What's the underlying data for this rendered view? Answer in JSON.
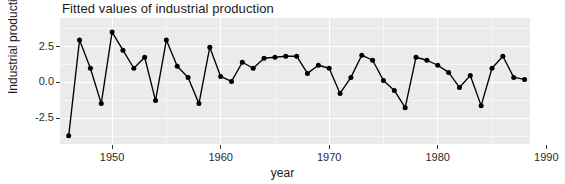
{
  "chart_data": {
    "type": "line",
    "title": "Fitted values of industrial production",
    "xlabel": "year",
    "ylabel": "Industrial production",
    "grid": true,
    "legend": false,
    "xlim": [
      1945.2,
      1988.5
    ],
    "ylim": [
      -4.3,
      4.5
    ],
    "xticks": [
      1950,
      1960,
      1970,
      1980,
      1990
    ],
    "xtick_labels": [
      "1950",
      "1960",
      "1970",
      "1980",
      "1990"
    ],
    "yticks": [
      -2.5,
      0.0,
      2.5
    ],
    "ytick_labels": [
      "-2.5",
      "0.0",
      "2.5"
    ],
    "marker": "filled-circle",
    "line_color": "#000000",
    "point_color": "#000000",
    "panel_color": "#ebebeb",
    "grid_color": "#ffffff",
    "x": [
      1946,
      1947,
      1948,
      1949,
      1950,
      1951,
      1952,
      1953,
      1954,
      1955,
      1956,
      1957,
      1958,
      1959,
      1960,
      1961,
      1962,
      1963,
      1964,
      1965,
      1966,
      1967,
      1968,
      1969,
      1970,
      1971,
      1972,
      1973,
      1974,
      1975,
      1976,
      1977,
      1978,
      1979,
      1980,
      1981,
      1982,
      1983,
      1984,
      1985,
      1986,
      1987,
      1988
    ],
    "values": [
      -3.73,
      2.96,
      0.99,
      -1.48,
      3.52,
      2.25,
      0.99,
      1.76,
      -1.27,
      2.96,
      1.13,
      0.35,
      -1.48,
      2.46,
      0.42,
      0.07,
      1.41,
      0.99,
      1.69,
      1.76,
      1.83,
      1.83,
      0.63,
      1.2,
      0.99,
      -0.77,
      0.35,
      1.9,
      1.55,
      0.14,
      -0.56,
      -1.76,
      1.76,
      1.55,
      1.2,
      0.7,
      -0.35,
      0.49,
      -1.62,
      0.99,
      1.83,
      0.35,
      0.21
    ],
    "series": [
      {
        "name": "Fitted industrial production",
        "values": [
          -3.73,
          2.96,
          0.99,
          -1.48,
          3.52,
          2.25,
          0.99,
          1.76,
          -1.27,
          2.96,
          1.13,
          0.35,
          -1.48,
          2.46,
          0.42,
          0.07,
          1.41,
          0.99,
          1.69,
          1.76,
          1.83,
          1.83,
          0.63,
          1.2,
          0.99,
          -0.77,
          0.35,
          1.9,
          1.55,
          0.14,
          -0.56,
          -1.76,
          1.76,
          1.55,
          1.2,
          0.7,
          -0.35,
          0.49,
          -1.62,
          0.99,
          1.83,
          0.35,
          0.21
        ]
      }
    ]
  }
}
